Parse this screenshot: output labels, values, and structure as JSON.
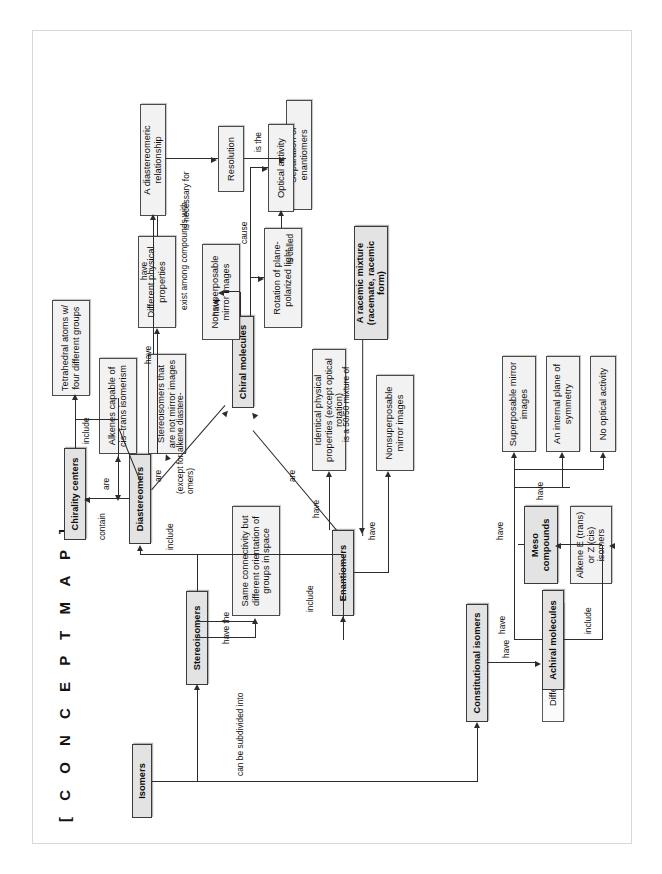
{
  "page": {
    "title": "[ C O N C E P T   M A P ]",
    "orientation": "landscape-rotated-90ccw",
    "background": "#ffffff",
    "frame_color": "#d8d8d8"
  },
  "colors": {
    "key_node_fill": "#e3e3e3",
    "node_fill": "#f2f2f2",
    "plain_node_fill": "#fbfbfb",
    "node_border": "#4a4a4a",
    "line": "#2c2c2c",
    "text": "#0d0d0d"
  },
  "nodes": [
    {
      "id": "isomers",
      "label": "Isomers",
      "kind": "key"
    },
    {
      "id": "constitutional",
      "label": "Constitutional isomers",
      "kind": "key"
    },
    {
      "id": "diff_connectivity",
      "label": "Different connectivity",
      "kind": "plain"
    },
    {
      "id": "stereoisomers",
      "label": "Stereoisomers",
      "kind": "key"
    },
    {
      "id": "same_conn",
      "label": "Same connectivity but different orientation of groups in space",
      "kind": "node"
    },
    {
      "id": "diastereomers",
      "label": "Diastereomers",
      "kind": "key"
    },
    {
      "id": "chirality_centers",
      "label": "Chirality centers",
      "kind": "key"
    },
    {
      "id": "tetrahedral",
      "label": "Tetrahedral atoms w/ four different groups",
      "kind": "node"
    },
    {
      "id": "alkenes_cistrans",
      "label": "Alkenes capable of cis–trans isomerism",
      "kind": "node"
    },
    {
      "id": "stereo_not_mirror",
      "label": "Stereoisomers that are not mirror images",
      "kind": "node"
    },
    {
      "id": "diff_phys_props",
      "label": "Different physical properties",
      "kind": "node"
    },
    {
      "id": "diastereomeric_rel",
      "label": "A diastereomeric relationship",
      "kind": "node"
    },
    {
      "id": "resolution",
      "label": "Resolution",
      "kind": "node"
    },
    {
      "id": "separation",
      "label": "Separation of enantiomers",
      "kind": "node"
    },
    {
      "id": "enantiomers",
      "label": "Enantiomers",
      "kind": "key"
    },
    {
      "id": "nonsuper_mirror_e",
      "label": "Nonsuperposable mirror images",
      "kind": "node"
    },
    {
      "id": "identical_phys",
      "label": "Identical physical properties (except optical rotation)",
      "kind": "node"
    },
    {
      "id": "racemic",
      "label": "A racemic mixture (racemate, racemic form)",
      "kind": "key"
    },
    {
      "id": "chiral_molecules",
      "label": "Chiral molecules",
      "kind": "key"
    },
    {
      "id": "nonsuper_mirror_c",
      "label": "Nonsuperposable mirror images",
      "kind": "node"
    },
    {
      "id": "rotation_ppl",
      "label": "Rotation of plane-polarized light",
      "kind": "node"
    },
    {
      "id": "optical_activity",
      "label": "Optical activity",
      "kind": "node"
    },
    {
      "id": "achiral_molecules",
      "label": "Achiral molecules",
      "kind": "key"
    },
    {
      "id": "super_mirror",
      "label": "Superposable mirror images",
      "kind": "node"
    },
    {
      "id": "internal_plane",
      "label": "An internal plane of symmetry",
      "kind": "node"
    },
    {
      "id": "no_optical",
      "label": "No optical activity",
      "kind": "node"
    },
    {
      "id": "meso",
      "label": "Meso compounds",
      "kind": "key"
    },
    {
      "id": "alkene_ez",
      "label": "Alkene E (trans) or Z (cis) isomers",
      "kind": "node"
    }
  ],
  "edge_labels": {
    "can_be_subdivided_into": "can be subdivided into",
    "have_constitutional": "have",
    "have_the": "have the",
    "include_diastereomers": "include",
    "include_enantiomers": "include",
    "contain": "contain",
    "include_chirality": "include",
    "are_alkenes": "are",
    "are_stereo_not_mirror": "are",
    "have_diastereomers": "have",
    "have_to_diastereomeric": "have",
    "exist_among_compounds_with": "exist among compounds with",
    "is_necessary_for": "is necessary for",
    "is_the": "is the",
    "are_diastereomers_chiral": "(except for alkene diastere-\nomers)",
    "are_enantiomers_chiral": "are",
    "have_enantiomers_mirror": "have",
    "have_enantiomers_identical": "have",
    "is_a_5050_mixture_of": "is a 50/50 mixture of",
    "have_chiral_mirror": "have",
    "cause": "cause",
    "is_called": "is called",
    "include_achiral": "include",
    "have_achiral": "have",
    "have_meso": "have",
    "have_alkene_ez": "have"
  }
}
